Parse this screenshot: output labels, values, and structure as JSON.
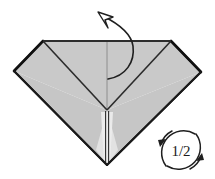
{
  "figure": {
    "kind": "origami-fold-diagram",
    "background_color": "#ffffff"
  },
  "model": {
    "name": "folded-paper-kite-shape",
    "fill_top": "#c9c9c9",
    "fill_lower": "#c4c4c4",
    "fill_center_lower": "#e4e4e4",
    "edge_color": "#1f1f1f",
    "crease_color": "#8c8c8c",
    "vertices": {
      "top_left": [
        43,
        41
      ],
      "top_right": [
        171,
        41
      ],
      "left": [
        14,
        71
      ],
      "right": [
        201,
        72
      ],
      "center": [
        107,
        110
      ],
      "bottom": [
        107,
        165
      ]
    }
  },
  "annotations": {
    "unfold_arrow": {
      "name": "unfold-arrow",
      "style": "curved-open-arrowhead",
      "start": [
        108,
        78
      ],
      "end": [
        100,
        13
      ],
      "color": "#1f1f1f"
    },
    "rotate_symbol": {
      "name": "rotate-half-turn",
      "label": "1/2",
      "center": [
        181,
        150
      ],
      "radius": 22,
      "color": "#1f1f1f",
      "arrowheads": 2
    }
  }
}
